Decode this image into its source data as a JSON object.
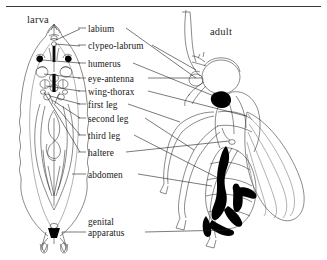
{
  "figure": {
    "type": "scientific-line-drawing",
    "top_rule": true,
    "panels": [
      {
        "id": "larva",
        "title": "larva",
        "side": "left"
      },
      {
        "id": "adult",
        "title": "adult",
        "side": "right"
      }
    ],
    "labels": [
      {
        "id": "labium",
        "text": "labium",
        "x": 88,
        "y": 31,
        "leader_left": true,
        "leader_right": true
      },
      {
        "id": "clypeo-labrum",
        "text": "clypeo-labrum",
        "x": 88,
        "y": 48,
        "leader_left": true,
        "leader_right": true
      },
      {
        "id": "humerus",
        "text": "humerus",
        "x": 88,
        "y": 66,
        "leader_left": true,
        "leader_right": true
      },
      {
        "id": "eye-antenna",
        "text": "eye-antenna",
        "x": 88,
        "y": 81,
        "leader_left": true,
        "leader_right": true
      },
      {
        "id": "wing-thorax",
        "text": "wing-thorax",
        "x": 88,
        "y": 94,
        "leader_left": true,
        "leader_right": true
      },
      {
        "id": "first-leg",
        "text": "first leg",
        "x": 88,
        "y": 107,
        "leader_left": true,
        "leader_right": true
      },
      {
        "id": "second-leg",
        "text": "second leg",
        "x": 88,
        "y": 121,
        "leader_left": true,
        "leader_right": true
      },
      {
        "id": "third-leg",
        "text": "third leg",
        "x": 88,
        "y": 138,
        "leader_left": true,
        "leader_right": true
      },
      {
        "id": "haltere",
        "text": "haltere",
        "x": 88,
        "y": 155,
        "leader_left": true,
        "leader_right": true
      },
      {
        "id": "abdomen",
        "text": "abdomen",
        "x": 88,
        "y": 177,
        "leader_left": true,
        "leader_right": true
      },
      {
        "id": "genital-apparatus-line1",
        "text": "genital",
        "x": 88,
        "y": 224,
        "leader_left": false,
        "leader_right": false
      },
      {
        "id": "genital-apparatus-line2",
        "text": "apparatus",
        "x": 88,
        "y": 235,
        "leader_left": true,
        "leader_right": true
      }
    ],
    "colors": {
      "ink": "#1a1a1a",
      "line": "#2b2b2b",
      "fill_black": "#000000",
      "background": "#ffffff"
    }
  }
}
